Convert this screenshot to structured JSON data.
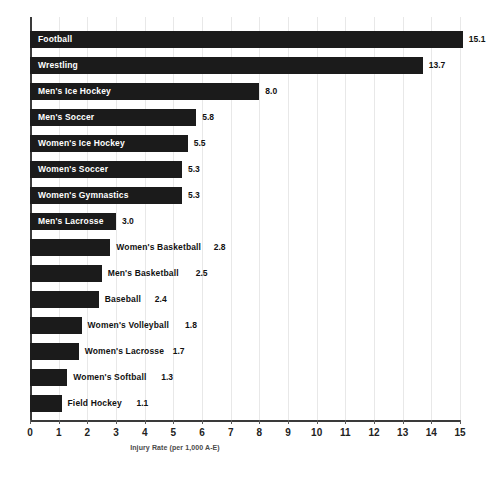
{
  "chart_data": {
    "type": "bar",
    "orientation": "horizontal",
    "title": "",
    "subtitle": "",
    "xlabel": "Injury Rate (per 1,000 A-E)",
    "ylabel": "",
    "xlim": [
      0,
      15
    ],
    "xticks": [
      0,
      1,
      2,
      3,
      4,
      5,
      6,
      7,
      8,
      9,
      10,
      11,
      12,
      13,
      14,
      15
    ],
    "xtick_labels": [
      "0",
      "1",
      "2",
      "3",
      "4",
      "5",
      "6",
      "7",
      "8",
      "9",
      "10",
      "11",
      "12",
      "13",
      "14",
      "15"
    ],
    "grid": true,
    "grid_axis": "x",
    "legend": false,
    "legend_position": "none",
    "bar_color": "#1b1b1b",
    "categories": [
      "Football",
      "Wrestling",
      "Men's Ice Hockey",
      "Men's Soccer",
      "Women's Ice Hockey",
      "Women's Soccer",
      "Women's Gymnastics",
      "Men's Lacrosse",
      "Women's Basketball",
      "Men's Basketball",
      "Baseball",
      "Women's Volleyball",
      "Women's Lacrosse",
      "Women's Softball",
      "Field Hockey"
    ],
    "values": [
      15.1,
      13.7,
      8.0,
      5.8,
      5.5,
      5.3,
      5.3,
      3.0,
      2.8,
      2.5,
      2.4,
      1.8,
      1.7,
      1.3,
      1.1
    ],
    "value_labels": [
      "15.1",
      "13.7",
      "8.0",
      "5.8",
      "5.5",
      "5.3",
      "5.3",
      "3.0",
      "2.8",
      "2.5",
      "2.4",
      "1.8",
      "1.7",
      "1.3",
      "1.1"
    ],
    "label_placement": [
      "inside",
      "inside",
      "inside",
      "inside",
      "inside",
      "inside",
      "inside",
      "inside",
      "outside",
      "outside",
      "outside",
      "outside",
      "outside",
      "outside",
      "outside"
    ]
  },
  "axis": {
    "x_title": "Injury Rate (per 1,000 A-E)"
  }
}
